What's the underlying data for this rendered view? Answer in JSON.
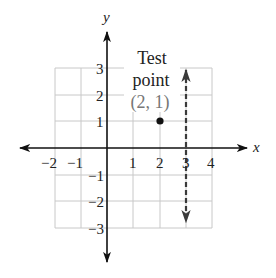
{
  "diagram": {
    "type": "coordinate-plane",
    "axes": {
      "x_label": "x",
      "y_label": "y",
      "x_ticks": [
        "−2",
        "−1",
        "1",
        "2",
        "3",
        "4"
      ],
      "y_ticks_positive": [
        "3",
        "2",
        "1"
      ],
      "y_ticks_negative": [
        "−1",
        "−2",
        "−3"
      ]
    },
    "grid": {
      "x_range": [
        -2,
        4
      ],
      "y_range": [
        -3,
        3
      ]
    },
    "test_point": {
      "label_line1": "Test",
      "label_line2": "point",
      "coords": "(2, 1)",
      "x": 2,
      "y": 1
    },
    "boundary_line": {
      "equation": "x = 3",
      "style": "dashed",
      "x": 3
    },
    "colors": {
      "grid": "#c8c8c8",
      "axis": "#111111",
      "dashed_line": "#3a3a3a",
      "coord_text": "#777777",
      "text": "#222222"
    }
  }
}
